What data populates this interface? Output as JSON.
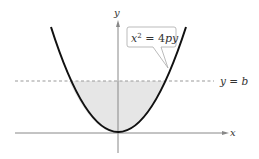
{
  "figure": {
    "axes": {
      "x_label": "x",
      "y_label": "y"
    },
    "curve": {
      "equation_base": "x",
      "equation_exponent": "2",
      "equation_rest": " = 4py",
      "equation_full": "x^2 = 4py"
    },
    "horizontal_line": {
      "label": "y = b",
      "style": "dashed"
    },
    "shaded_region": {
      "description": "Region between parabola and y = b",
      "fill": "#e6e6e6"
    },
    "colors": {
      "curve": "#111111",
      "axes": "#888888",
      "dashed_line": "#999999",
      "shade": "#e6e6e6",
      "callout_border": "#aaaaaa"
    }
  }
}
